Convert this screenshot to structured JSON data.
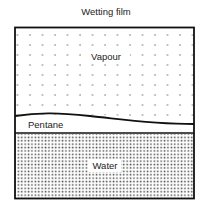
{
  "diagram": {
    "title": "Wetting film",
    "regions": [
      {
        "name": "vapour",
        "label": "Vapour",
        "pattern": "sparse-dots"
      },
      {
        "name": "pentane",
        "label": "Pentane",
        "pattern": "blank"
      },
      {
        "name": "water",
        "label": "Water",
        "pattern": "dense-stipple"
      }
    ],
    "colors": {
      "line": "#111111",
      "fill": "#ffffff",
      "dot": "#555555"
    }
  }
}
